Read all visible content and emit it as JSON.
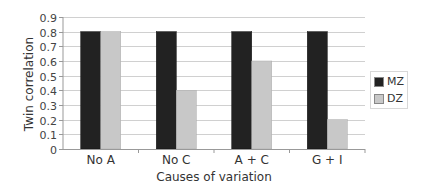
{
  "chart_data": {
    "type": "bar",
    "title": "",
    "xlabel": "Causes of variation",
    "ylabel": "Twin correlation",
    "categories": [
      "No A",
      "No C",
      "A + C",
      "G + I"
    ],
    "series": [
      {
        "name": "MZ",
        "values": [
          0.8,
          0.8,
          0.8,
          0.8
        ],
        "color": "#222222"
      },
      {
        "name": "DZ",
        "values": [
          0.8,
          0.4,
          0.6,
          0.2
        ],
        "color": "#c8c8c8"
      }
    ],
    "ylim": [
      0,
      0.9
    ],
    "yticks": [
      "0",
      "0.1",
      "0.2",
      "0.3",
      "0.4",
      "0.5",
      "0.6",
      "0.7",
      "0.8",
      "0.9"
    ],
    "grid": true,
    "legend_position": "right"
  },
  "legend": {
    "items": [
      {
        "label": "MZ",
        "color": "#222222"
      },
      {
        "label": "DZ",
        "color": "#c8c8c8"
      }
    ]
  }
}
